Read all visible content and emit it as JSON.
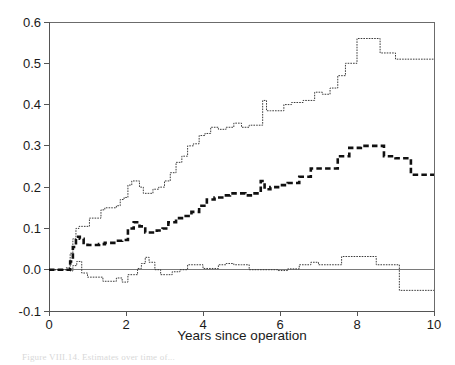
{
  "figure": {
    "caption": "Figure VIII.14. Estimates over time of..."
  },
  "chart_data": {
    "type": "line",
    "title": "",
    "subtitle": "",
    "xlabel": "Years since operation",
    "ylabel": "",
    "xlim": [
      0,
      10
    ],
    "ylim": [
      -0.1,
      0.6
    ],
    "xticks": [
      "0",
      "2",
      "4",
      "6",
      "8",
      "10"
    ],
    "xtick_values": [
      0,
      2,
      4,
      6,
      8,
      10
    ],
    "yticks": [
      "-0.1",
      "0.0",
      "0.1",
      "0.2",
      "0.3",
      "0.4",
      "0.5",
      "0.6"
    ],
    "ytick_values": [
      -0.1,
      0,
      0.1,
      0.2,
      0.3,
      0.4,
      0.5,
      0.6
    ],
    "grid": false,
    "legend": null,
    "legend_position": "none",
    "step_style": "post",
    "annotations": [
      "Horizontal reference line drawn at y = 0.0"
    ],
    "reference_lines": [
      {
        "axis": "y",
        "value": 0.0
      }
    ],
    "series": [
      {
        "name": "upper-band",
        "style": "thin-dotted-step",
        "x": [
          0,
          0.15,
          0.3,
          0.45,
          0.55,
          0.62,
          0.7,
          0.78,
          0.86,
          0.95,
          1.05,
          1.15,
          1.25,
          1.35,
          1.45,
          1.55,
          1.65,
          1.75,
          1.85,
          1.95,
          2.05,
          2.15,
          2.25,
          2.35,
          2.45,
          2.55,
          2.7,
          2.85,
          3.0,
          3.15,
          3.3,
          3.45,
          3.6,
          3.75,
          3.9,
          4.05,
          4.2,
          4.4,
          4.6,
          4.8,
          5.0,
          5.2,
          5.4,
          5.55,
          5.65,
          5.75,
          5.9,
          6.1,
          6.3,
          6.6,
          6.9,
          7.1,
          7.3,
          7.5,
          7.7,
          8.0,
          8.3,
          8.6,
          9.0,
          9.5,
          10.0
        ],
        "y": [
          0.0,
          0.0,
          0.0,
          0.005,
          0.04,
          0.075,
          0.1,
          0.105,
          0.105,
          0.105,
          0.125,
          0.125,
          0.125,
          0.145,
          0.15,
          0.15,
          0.15,
          0.155,
          0.17,
          0.175,
          0.205,
          0.215,
          0.215,
          0.2,
          0.185,
          0.185,
          0.195,
          0.2,
          0.215,
          0.235,
          0.26,
          0.275,
          0.3,
          0.305,
          0.325,
          0.33,
          0.345,
          0.34,
          0.345,
          0.355,
          0.345,
          0.35,
          0.35,
          0.41,
          0.385,
          0.385,
          0.385,
          0.4,
          0.405,
          0.41,
          0.43,
          0.425,
          0.44,
          0.47,
          0.5,
          0.56,
          0.56,
          0.525,
          0.51,
          0.51,
          0.51
        ]
      },
      {
        "name": "point-estimate",
        "style": "thick-dashed-step",
        "x": [
          0,
          0.2,
          0.4,
          0.55,
          0.62,
          0.7,
          0.8,
          0.9,
          1.0,
          1.1,
          1.2,
          1.3,
          1.45,
          1.6,
          1.75,
          1.9,
          2.05,
          2.2,
          2.35,
          2.5,
          2.65,
          2.8,
          2.95,
          3.1,
          3.3,
          3.5,
          3.7,
          3.9,
          4.1,
          4.3,
          4.5,
          4.7,
          4.9,
          5.1,
          5.3,
          5.5,
          5.6,
          5.75,
          5.95,
          6.2,
          6.5,
          6.8,
          7.0,
          7.25,
          7.5,
          7.8,
          8.1,
          8.4,
          8.7,
          9.0,
          9.4,
          10.0
        ],
        "y": [
          0.0,
          0.0,
          0.0,
          0.02,
          0.055,
          0.08,
          0.075,
          0.065,
          0.06,
          0.06,
          0.06,
          0.062,
          0.065,
          0.065,
          0.07,
          0.072,
          0.1,
          0.115,
          0.105,
          0.09,
          0.09,
          0.095,
          0.1,
          0.115,
          0.125,
          0.13,
          0.14,
          0.155,
          0.17,
          0.175,
          0.18,
          0.185,
          0.185,
          0.18,
          0.185,
          0.215,
          0.195,
          0.2,
          0.205,
          0.21,
          0.225,
          0.245,
          0.245,
          0.245,
          0.275,
          0.295,
          0.3,
          0.3,
          0.275,
          0.27,
          0.23,
          0.23
        ]
      },
      {
        "name": "lower-band",
        "style": "thin-dotted-step",
        "x": [
          0,
          0.2,
          0.4,
          0.55,
          0.62,
          0.72,
          0.85,
          1.0,
          1.2,
          1.4,
          1.6,
          1.75,
          1.9,
          2.05,
          2.2,
          2.3,
          2.4,
          2.5,
          2.6,
          2.75,
          2.9,
          3.05,
          3.2,
          3.4,
          3.6,
          3.8,
          4.0,
          4.2,
          4.4,
          4.6,
          4.8,
          5.0,
          5.2,
          5.45,
          5.7,
          5.95,
          6.2,
          6.5,
          6.8,
          7.0,
          7.3,
          7.6,
          7.9,
          8.2,
          8.5,
          8.8,
          9.1,
          9.5,
          10.0
        ],
        "y": [
          0.0,
          0.0,
          0.0,
          -0.003,
          0.01,
          0.02,
          -0.008,
          -0.018,
          -0.018,
          -0.028,
          -0.028,
          -0.02,
          -0.03,
          -0.012,
          -0.012,
          0.003,
          0.015,
          0.03,
          0.018,
          0.0,
          -0.012,
          -0.012,
          -0.005,
          0.0,
          0.012,
          0.012,
          0.003,
          0.003,
          0.012,
          0.015,
          0.012,
          0.012,
          0.0,
          0.0,
          0.0,
          -0.002,
          0.002,
          0.012,
          0.018,
          0.012,
          0.012,
          0.032,
          0.032,
          0.032,
          0.012,
          0.012,
          -0.05,
          -0.05,
          -0.05
        ]
      }
    ]
  }
}
